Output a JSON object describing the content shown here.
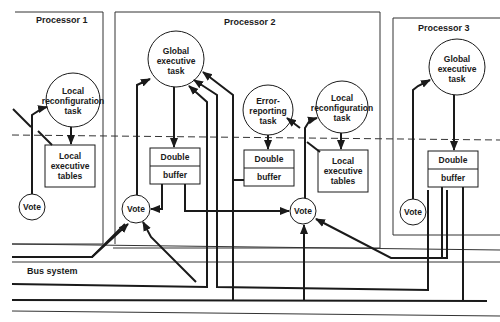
{
  "diagram": {
    "type": "architecture-diagram",
    "bus_label": "Bus system",
    "processors": [
      {
        "title": "Processor 1",
        "nodes": {
          "local_reconfig": [
            "Local",
            "reconfiguration",
            "task"
          ],
          "local_tables": [
            "Local",
            "executive",
            "tables"
          ],
          "vote": "Vote"
        }
      },
      {
        "title": "Processor 2",
        "nodes": {
          "global_exec": [
            "Global",
            "executive",
            "task"
          ],
          "buffer_a": [
            "Double",
            "buffer"
          ],
          "vote_a": "Vote",
          "error_report": [
            "Error-",
            "reporting",
            "task"
          ],
          "buffer_b": [
            "Double",
            "buffer"
          ],
          "local_reconfig": [
            "Local",
            "reconfiguration",
            "task"
          ],
          "local_tables": [
            "Local",
            "executive",
            "tables"
          ],
          "vote_b": "Vote"
        }
      },
      {
        "title": "Processor 3",
        "nodes": {
          "global_exec": [
            "Global",
            "executive",
            "task"
          ],
          "buffer": [
            "Double",
            "buffer"
          ],
          "vote": "Vote"
        }
      }
    ],
    "colors": {
      "line": "#1a1a1a",
      "background": "#ffffff",
      "thin_line": "#333333"
    }
  }
}
